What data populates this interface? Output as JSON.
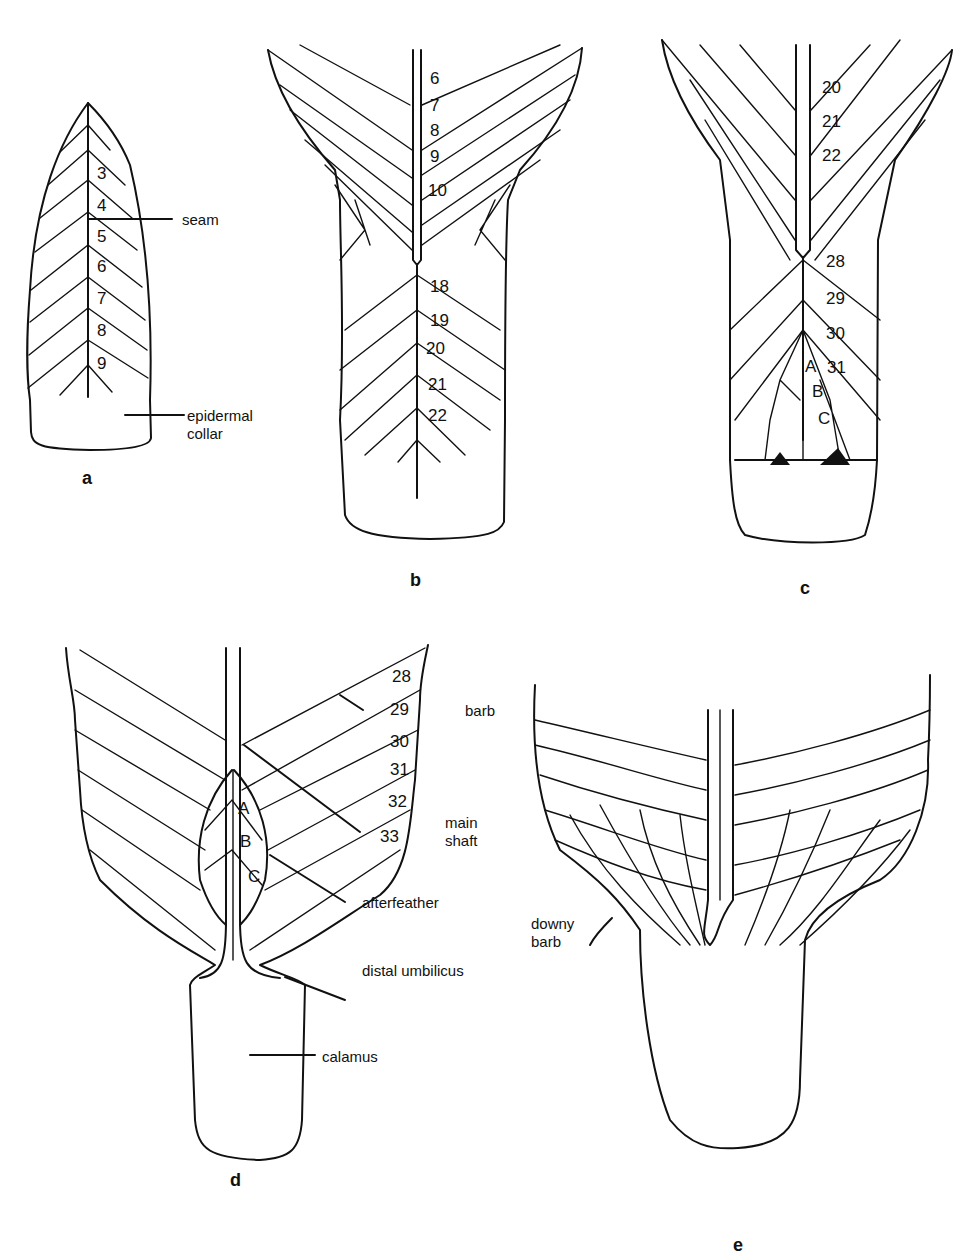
{
  "figure": {
    "panels": [
      {
        "id": "a",
        "caption": "a",
        "barb_numbers": [
          "3",
          "4",
          "5",
          "6",
          "7",
          "8",
          "9"
        ],
        "labels": {
          "seam": "seam",
          "epidermal_collar_1": "epidermal",
          "epidermal_collar_2": "collar"
        }
      },
      {
        "id": "b",
        "caption": "b",
        "barb_numbers_upper": [
          "6",
          "7",
          "8",
          "9",
          "10"
        ],
        "barb_numbers_lower": [
          "18",
          "19",
          "20",
          "21",
          "22"
        ]
      },
      {
        "id": "c",
        "caption": "c",
        "barb_numbers_upper": [
          "20",
          "21",
          "22"
        ],
        "barb_numbers_lower": [
          "28",
          "29",
          "30",
          "31"
        ],
        "afterfeather_letters": [
          "A",
          "B",
          "C"
        ]
      },
      {
        "id": "d",
        "caption": "d",
        "barb_numbers": [
          "28",
          "29",
          "30",
          "31",
          "32",
          "33"
        ],
        "afterfeather_letters": [
          "A",
          "B",
          "C"
        ],
        "labels": {
          "barb": "barb",
          "main_shaft_1": "main",
          "main_shaft_2": "shaft",
          "afterfeather": "afterfeather",
          "distal_umbilicus": "distal umbilicus",
          "calamus": "calamus"
        }
      },
      {
        "id": "e",
        "caption": "e",
        "labels": {
          "downy_barb_1": "downy",
          "downy_barb_2": "barb"
        }
      }
    ]
  }
}
